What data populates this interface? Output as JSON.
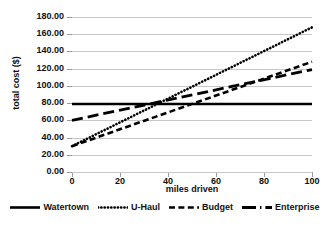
{
  "chart_data": {
    "type": "line",
    "title": "",
    "xlabel": "miles driven",
    "ylabel": "total cost ($)",
    "xlim": [
      0,
      100
    ],
    "ylim": [
      0,
      180
    ],
    "grid": true,
    "legend_position": "bottom",
    "x": [
      0,
      100
    ],
    "xticks": [
      "0",
      "20",
      "40",
      "60",
      "80",
      "100"
    ],
    "yticks": [
      "0.00",
      "20.00",
      "40.00",
      "60.00",
      "80.00",
      "100.00",
      "120.00",
      "140.00",
      "160.00",
      "180.00"
    ],
    "series": [
      {
        "name": "Watertown",
        "values": [
          79,
          79
        ],
        "style": "solid",
        "color": "#000000"
      },
      {
        "name": "U-Haul",
        "values": [
          30,
          168
        ],
        "style": "dotted",
        "color": "#000000"
      },
      {
        "name": "Budget",
        "values": [
          30,
          128
        ],
        "style": "dashed",
        "color": "#000000"
      },
      {
        "name": "Enterprise",
        "values": [
          60,
          119
        ],
        "style": "long-dash",
        "color": "#000000"
      }
    ]
  },
  "legend": {
    "items": [
      {
        "label": "Watertown"
      },
      {
        "label": "U-Haul"
      },
      {
        "label": "Budget"
      },
      {
        "label": "Enterprise"
      }
    ]
  }
}
